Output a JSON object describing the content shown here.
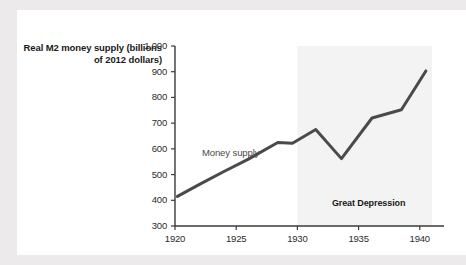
{
  "figure": {
    "background_color": "#ffffff",
    "page_background_color": "#eceaea",
    "line_color": "#4a4a4a",
    "shade_color": "#f4f3f3",
    "axis_color": "#3a3a3a"
  },
  "axis_title": "Real M2 money supply (billions of 2012 dollars)",
  "series_label": "Money supply",
  "band_label": "Great Depression",
  "chart_data": {
    "type": "line",
    "title": "",
    "xlabel": "",
    "ylabel": "Real M2 money supply (billions of 2012 dollars)",
    "xlim": [
      1920,
      1941
    ],
    "ylim": [
      300,
      1000
    ],
    "yticks": [
      300,
      400,
      500,
      600,
      700,
      800,
      900,
      1000
    ],
    "ytick_labels": [
      "300",
      "400",
      "500",
      "600",
      "700",
      "800",
      "900",
      "1,000"
    ],
    "xticks": [
      1920,
      1925,
      1930,
      1935,
      1940
    ],
    "xtick_labels": [
      "1920",
      "1925",
      "1930",
      "1935",
      "1940"
    ],
    "grid": false,
    "legend": false,
    "series": [
      {
        "name": "Money supply",
        "x": [
          1920.2,
          1922.0,
          1924.0,
          1926.0,
          1928.4,
          1929.6,
          1931.5,
          1933.6,
          1936.1,
          1938.5,
          1940.5
        ],
        "values": [
          415,
          462,
          512,
          560,
          625,
          622,
          675,
          562,
          720,
          752,
          903
        ]
      }
    ],
    "annotations": [
      {
        "text": "Great Depression",
        "x": 1935.6,
        "y": 385,
        "type": "band-label"
      },
      {
        "text": "Money supply",
        "x": 1922.2,
        "y": 585,
        "type": "series-label"
      }
    ],
    "shaded_regions": [
      {
        "label": "Great Depression",
        "x_start": 1930.0,
        "x_end": 1941.0,
        "color": "#f4f3f3"
      }
    ]
  }
}
